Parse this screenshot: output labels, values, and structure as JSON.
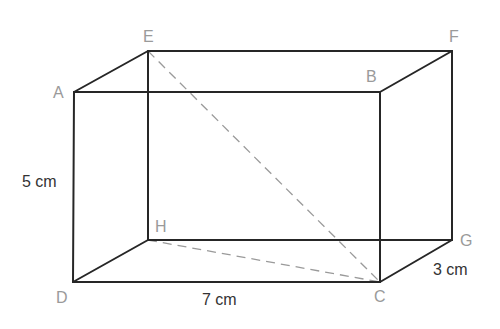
{
  "diagram": {
    "type": "cuboid",
    "vertices": {
      "A": {
        "label": "A",
        "x": 74,
        "y": 92
      },
      "B": {
        "label": "B",
        "x": 380,
        "y": 92
      },
      "C": {
        "label": "C",
        "x": 380,
        "y": 282
      },
      "D": {
        "label": "D",
        "x": 73,
        "y": 282
      },
      "E": {
        "label": "E",
        "x": 148,
        "y": 51
      },
      "F": {
        "label": "F",
        "x": 452,
        "y": 51
      },
      "G": {
        "label": "G",
        "x": 452,
        "y": 240
      },
      "H": {
        "label": "H",
        "x": 148,
        "y": 240
      }
    },
    "solid_edges": [
      "AB",
      "BC",
      "CD",
      "DA",
      "EF",
      "FG",
      "GH",
      "HE",
      "AE",
      "BF",
      "CG",
      "DH"
    ],
    "dashed_edges": [
      "EC",
      "HC"
    ],
    "dimensions": {
      "height": "5 cm",
      "length": "7 cm",
      "depth": "3 cm"
    },
    "colors": {
      "edge": "#262626",
      "dashed": "#9a9a9a",
      "vertex_label": "#9a9a9a",
      "dimension_label": "#333333"
    }
  }
}
